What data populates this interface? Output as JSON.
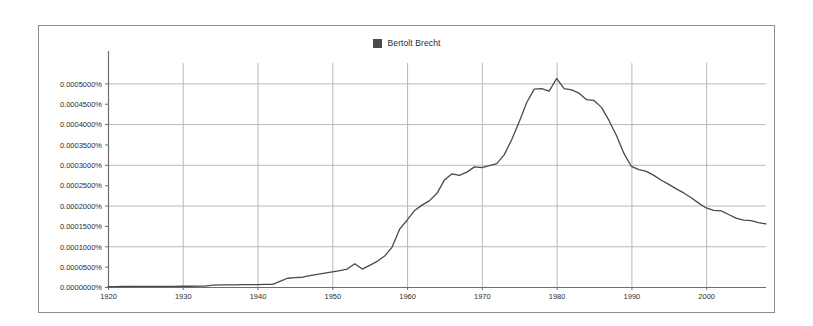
{
  "legend": {
    "swatch_color": "#4a4a4a",
    "label": "Bertolt Brecht"
  },
  "axes": {
    "y_tick_labels": [
      "0.0005000%",
      "0.0004500%",
      "0.0004000%",
      "0.0003500%",
      "0.0003000%",
      "0.0002500%",
      "0.0002000%",
      "0.0001500%",
      "0.0001000%",
      "0.0000500%",
      "0.0000000%"
    ],
    "x_tick_labels": [
      "1920",
      "1930",
      "1940",
      "1950",
      "1960",
      "1970",
      "1980",
      "1990",
      "2000"
    ]
  },
  "chart_data": {
    "type": "line",
    "title": "",
    "subtitle": "",
    "xlabel": "",
    "ylabel": "",
    "xlim": [
      1920,
      2008
    ],
    "ylim": [
      0.0,
      0.00055
    ],
    "grid": true,
    "grid_y_values": [
      0.0001,
      0.0002,
      0.0003,
      0.0004,
      0.0005
    ],
    "grid_x_values": [
      1920,
      1930,
      1940,
      1950,
      1960,
      1970,
      1980,
      1990,
      2000
    ],
    "y_tick_values": [
      0.0005,
      0.00045,
      0.0004,
      0.00035,
      0.0003,
      0.00025,
      0.0002,
      0.00015,
      0.0001,
      5e-05,
      0.0
    ],
    "x_tick_values": [
      1920,
      1930,
      1940,
      1950,
      1960,
      1970,
      1980,
      1990,
      2000
    ],
    "y_unit": "percent",
    "legend_position": "top-center",
    "line_color": "#4a4a4a",
    "line_width": 1.3,
    "series": [
      {
        "name": "Bertolt Brecht",
        "x": [
          1920,
          1921,
          1922,
          1923,
          1924,
          1925,
          1926,
          1927,
          1928,
          1929,
          1930,
          1931,
          1932,
          1933,
          1934,
          1935,
          1936,
          1937,
          1938,
          1939,
          1940,
          1941,
          1942,
          1943,
          1944,
          1945,
          1946,
          1947,
          1948,
          1949,
          1950,
          1951,
          1952,
          1953,
          1954,
          1955,
          1956,
          1957,
          1958,
          1959,
          1960,
          1961,
          1962,
          1963,
          1964,
          1965,
          1966,
          1967,
          1968,
          1969,
          1970,
          1971,
          1972,
          1973,
          1974,
          1975,
          1976,
          1977,
          1978,
          1979,
          1980,
          1981,
          1982,
          1983,
          1984,
          1985,
          1986,
          1987,
          1988,
          1989,
          1990,
          1991,
          1992,
          1993,
          1994,
          1995,
          1996,
          1997,
          1998,
          1999,
          2000,
          2001,
          2002,
          2003,
          2004,
          2005,
          2006,
          2007,
          2008
        ],
        "values": [
          1e-06,
          1e-06,
          1.2e-06,
          1.2e-06,
          1.3e-06,
          1.3e-06,
          1.4e-06,
          1.5e-06,
          1.6e-06,
          1.7e-06,
          1.8e-06,
          1.9e-06,
          2e-06,
          2.1e-06,
          4.5e-06,
          5e-06,
          5.2e-06,
          5.4e-06,
          5.6e-06,
          5.8e-06,
          6e-06,
          6.2e-06,
          6.5e-06,
          1.4e-05,
          2.15e-05,
          2.3e-05,
          2.4e-05,
          2.8e-05,
          3.1e-05,
          3.4e-05,
          3.7e-05,
          4e-05,
          4.4e-05,
          5.7e-05,
          4.4e-05,
          5.3e-05,
          6.3e-05,
          7.6e-05,
          9.8e-05,
          0.000142,
          0.000164,
          0.000188,
          0.000201,
          0.000212,
          0.00023,
          0.000263,
          0.000278,
          0.000274,
          0.000282,
          0.000295,
          0.000293,
          0.000298,
          0.000303,
          0.000325,
          0.000362,
          0.000406,
          0.000453,
          0.000486,
          0.000487,
          0.000481,
          0.000512,
          0.000487,
          0.000484,
          0.000476,
          0.00046,
          0.000458,
          0.000441,
          0.000409,
          0.000372,
          0.000328,
          0.000296,
          0.000288,
          0.000284,
          0.000274,
          0.000262,
          0.000252,
          0.000241,
          0.000231,
          0.000219,
          0.000206,
          0.000194,
          0.000188,
          0.000187,
          0.000178,
          0.000169,
          0.000164,
          0.000163,
          0.000158,
          0.000155
        ]
      }
    ]
  }
}
